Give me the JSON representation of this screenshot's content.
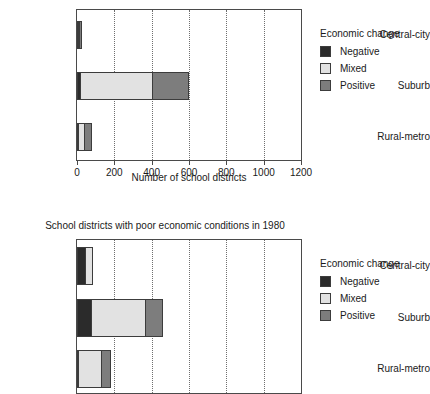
{
  "legend": {
    "title": "Economic change",
    "items": [
      {
        "label": "Negative",
        "color": "#2b2b2b"
      },
      {
        "label": "Mixed",
        "color": "#e2e2e2"
      },
      {
        "label": "Positive",
        "color": "#7d7d7d"
      }
    ]
  },
  "chart_data": [
    {
      "type": "bar",
      "orientation": "horizontal",
      "stacked": true,
      "title": "",
      "xlabel": "Number of school districts",
      "ylabel": "",
      "xlim": [
        0,
        1200
      ],
      "xticks": [
        0,
        200,
        400,
        600,
        800,
        1000,
        1200
      ],
      "xtick_labels": [
        "0",
        "200",
        "400",
        "600",
        "800",
        "1000",
        "1200"
      ],
      "grid": "vertical-dotted",
      "legend_position": "right",
      "categories": [
        "Central-city",
        "Suburb",
        "Rural-metro"
      ],
      "series": [
        {
          "name": "Negative",
          "color": "#2b2b2b",
          "values": [
            5,
            15,
            3
          ]
        },
        {
          "name": "Mixed",
          "color": "#e2e2e2",
          "values": [
            5,
            385,
            30
          ]
        },
        {
          "name": "Positive",
          "color": "#7d7d7d",
          "values": [
            15,
            200,
            45
          ]
        }
      ],
      "totals": [
        25,
        600,
        78
      ],
      "note": "chart title is cropped off the top edge of the screenshot"
    },
    {
      "type": "bar",
      "orientation": "horizontal",
      "stacked": true,
      "title": "School districts with poor economic conditions in 1980",
      "xlabel": "",
      "ylabel": "",
      "xlim": [
        0,
        1200
      ],
      "xticks": [
        0,
        200,
        400,
        600,
        800,
        1000,
        1200
      ],
      "xtick_labels": [],
      "grid": "vertical-dotted",
      "legend_position": "right",
      "categories": [
        "Central-city",
        "Suburb",
        "Rural-metro"
      ],
      "series": [
        {
          "name": "Negative",
          "color": "#2b2b2b",
          "values": [
            45,
            75,
            5
          ]
        },
        {
          "name": "Mixed",
          "color": "#e2e2e2",
          "values": [
            40,
            290,
            125
          ]
        },
        {
          "name": "Positive",
          "color": "#7d7d7d",
          "values": [
            0,
            95,
            50
          ]
        }
      ],
      "totals": [
        85,
        460,
        180
      ],
      "note": "x-axis line and tick labels are cropped off the bottom edge of the screenshot"
    }
  ]
}
